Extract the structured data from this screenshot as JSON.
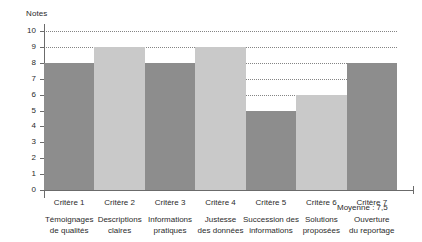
{
  "chart_data": {
    "type": "bar",
    "title": "",
    "subtitle": "",
    "xlabel": "",
    "ylabel": "Notes",
    "ylim": [
      0,
      10
    ],
    "grid": true,
    "legend": null,
    "categories": [
      "Critère 1",
      "Critère 2",
      "Critère 3",
      "Critère 4",
      "Critère 5",
      "Critère 6",
      "Critère 7"
    ],
    "category_descriptions": [
      [
        "Témoignages",
        "de qualités"
      ],
      [
        "Descriptions",
        "claires"
      ],
      [
        "Informations",
        "pratiques"
      ],
      [
        "Justesse",
        "des données"
      ],
      [
        "Succession des",
        "informations"
      ],
      [
        "Solutions",
        "proposées"
      ],
      [
        "Ouverture",
        "du reportage"
      ]
    ],
    "values": [
      8,
      9,
      8,
      9,
      5,
      6,
      8
    ],
    "bar_colors": [
      "#8d8d8d",
      "#c9c9c9",
      "#8d8d8d",
      "#c9c9c9",
      "#8d8d8d",
      "#c9c9c9",
      "#8d8d8d"
    ],
    "y_ticks": [
      10,
      9,
      8,
      7,
      6,
      5,
      4,
      3,
      2,
      1,
      0
    ],
    "annotations": [
      {
        "name": "average",
        "text": "Moyenne : 7,5"
      }
    ]
  },
  "colors": {
    "bar_dark": "#8d8d8d",
    "bar_light": "#c9c9c9",
    "axis": "#6b6b6b",
    "grid": "#6f6f6f",
    "text": "#2b2b2b",
    "background": "#ffffff"
  }
}
